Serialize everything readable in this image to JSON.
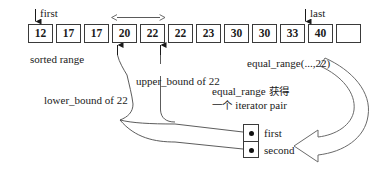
{
  "diagram": {
    "stroke_color": "#3a3a3a",
    "text_color": "#1a1a1a",
    "array": {
      "cells": [
        "12",
        "17",
        "17",
        "20",
        "22",
        "22",
        "23",
        "30",
        "30",
        "33",
        "40",
        ""
      ],
      "caption": "sorted range"
    },
    "pointers": {
      "first": "first",
      "last": "last"
    },
    "annotations": {
      "upper_bound": "upper_bound of 22",
      "lower_bound": "lower_bound of 22",
      "equal_range_call": "equal_range(...,22)",
      "cjk_line1_en": "equal_range",
      "cjk_line1_cjk": "获得",
      "cjk_line2_cjk": "一个",
      "cjk_line2_en": "iterator pair"
    },
    "pair": {
      "first_label": "first",
      "second_label": "second"
    },
    "icons": {
      "down_arrow": "down-arrow-icon",
      "up_arrow": "up-arrow-icon",
      "span_arrow": "double-headed-arrow-icon",
      "curved_block_arrow": "curved-block-arrow-icon"
    }
  }
}
